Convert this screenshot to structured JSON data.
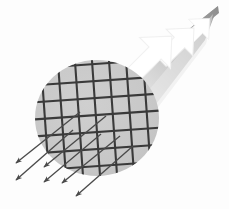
{
  "figure": {
    "canvas": {
      "width": 229,
      "height": 209
    },
    "background_color": "#fdfdfd"
  },
  "disk": {
    "label": "gridded sample disk",
    "fill_color": "#c9c9c9",
    "edge_color": "#bdbdbd",
    "center_x": 97,
    "center_y": 118,
    "radius_x": 62,
    "radius_y": 58
  },
  "grid": {
    "label": "mesh grid overlay",
    "line_color": "#3a3a3a",
    "line_width": 2.1,
    "cell_size": 17,
    "rows": 7,
    "columns": 7,
    "rotation_deg": -4
  },
  "beam_cone": {
    "label": "incident beam cone",
    "gradient_from": "#9b9b9b",
    "gradient_to": "#f2f2f2",
    "tip_x": 218,
    "tip_y": 6,
    "spread_note": "widens toward lower-left onto the disk"
  },
  "incident_arrows": {
    "label": "incident block arrows",
    "color": "#ffffff",
    "direction_deg": 225,
    "count": 3,
    "items": [
      {
        "name": "incident-arrow-1",
        "x": 196,
        "y": 32,
        "scale": 0.62
      },
      {
        "name": "incident-arrow-2",
        "x": 176,
        "y": 46,
        "scale": 0.82
      },
      {
        "name": "incident-arrow-3",
        "x": 152,
        "y": 56,
        "scale": 0.95
      }
    ]
  },
  "scattered_arrows": {
    "label": "scattered ray arrows",
    "color": "#4a4a4a",
    "line_width": 1.3,
    "direction_deg": 218,
    "count": 6,
    "items": [
      {
        "name": "scattered-ray-1",
        "x1": 80,
        "y1": 112,
        "x2": 16,
        "y2": 163
      },
      {
        "name": "scattered-ray-2",
        "x1": 73,
        "y1": 130,
        "x2": 16,
        "y2": 180
      },
      {
        "name": "scattered-ray-3",
        "x1": 106,
        "y1": 116,
        "x2": 44,
        "y2": 167
      },
      {
        "name": "scattered-ray-4",
        "x1": 101,
        "y1": 134,
        "x2": 44,
        "y2": 182
      },
      {
        "name": "scattered-ray-5",
        "x1": 120,
        "y1": 136,
        "x2": 62,
        "y2": 183
      },
      {
        "name": "scattered-ray-6",
        "x1": 133,
        "y1": 146,
        "x2": 76,
        "y2": 196
      }
    ]
  }
}
